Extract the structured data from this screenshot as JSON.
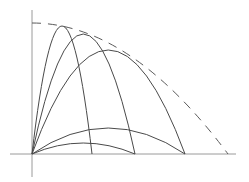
{
  "diagram": {
    "colors": {
      "stroke": "#4a4a4a",
      "axis": "#9a9a9a",
      "envelope": "#5a5a5a",
      "background": "#ffffff"
    },
    "origin": {
      "x": 32,
      "y": 154
    },
    "axes": {
      "vertical": {
        "x": 32,
        "y1": 10,
        "y2": 177
      },
      "horizontal": {
        "y": 154,
        "x1": 10,
        "x2": 236
      }
    },
    "trajectories": [
      {
        "name": "steep-1",
        "range_end_x": 92,
        "apex": {
          "x": 62,
          "y": 26
        }
      },
      {
        "name": "steep-2",
        "range_end_x": 135,
        "apex": {
          "x": 83,
          "y": 34
        }
      },
      {
        "name": "mid",
        "range_end_x": 185,
        "apex": {
          "x": 108,
          "y": 50
        }
      },
      {
        "name": "low-1",
        "range_end_x": 185,
        "apex": {
          "x": 108,
          "y": 128
        }
      },
      {
        "name": "low-2",
        "range_end_x": 135,
        "apex": {
          "x": 83,
          "y": 143
        }
      }
    ],
    "envelope": {
      "start": {
        "x": 32,
        "y": 23
      },
      "end": {
        "x": 228,
        "y": 154
      },
      "dashed": true
    }
  }
}
